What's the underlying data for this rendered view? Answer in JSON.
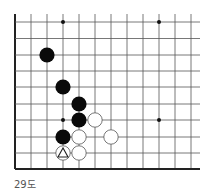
{
  "diagram": {
    "type": "go-board-fragment",
    "grid": {
      "columns_x": [
        15,
        31,
        47,
        63,
        79,
        95,
        111,
        127,
        143,
        159,
        175,
        191
      ],
      "rows_y": [
        22,
        38.5,
        55,
        71,
        87,
        104,
        120,
        137,
        153,
        169
      ],
      "left_edge": true,
      "bottom_edge": true,
      "line_color": "#555555",
      "edge_color": "#222222"
    },
    "star_points": [
      {
        "col": 3,
        "row": 0
      },
      {
        "col": 9,
        "row": 0
      },
      {
        "col": 3,
        "row": 6
      },
      {
        "col": 9,
        "row": 6
      }
    ],
    "stones": [
      {
        "color": "black",
        "col": 2,
        "row": 2
      },
      {
        "color": "black",
        "col": 3,
        "row": 4
      },
      {
        "color": "black",
        "col": 4,
        "row": 5
      },
      {
        "color": "black",
        "col": 4,
        "row": 6
      },
      {
        "color": "white",
        "col": 5,
        "row": 6
      },
      {
        "color": "black",
        "col": 3,
        "row": 7
      },
      {
        "color": "white",
        "col": 4,
        "row": 7
      },
      {
        "color": "white",
        "col": 6,
        "row": 7
      },
      {
        "color": "white",
        "col": 3,
        "row": 8,
        "marker": "triangle"
      },
      {
        "color": "white",
        "col": 4,
        "row": 8
      }
    ],
    "caption": "29도"
  }
}
